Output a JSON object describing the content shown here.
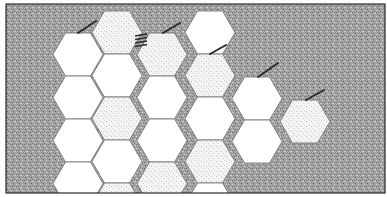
{
  "figure": {
    "width": 387,
    "height": 197,
    "frame": {
      "x": 6,
      "y": 4,
      "w": 379,
      "h": 189,
      "stroke": "#2a2a2a"
    },
    "background_color": "#9a9a9a",
    "hex": {
      "w": 50,
      "h": 43
    },
    "fills": {
      "white": "#ffffff",
      "stippled": "#ebebeb"
    },
    "outline_color": "#7a7a7a",
    "mark_color": "#2b2b2b",
    "columns": [
      {
        "name": "col-a",
        "x": 53,
        "cells": [
          {
            "y": 33,
            "fill": "white"
          },
          {
            "y": 76,
            "fill": "white"
          },
          {
            "y": 119,
            "fill": "white"
          },
          {
            "y": 162,
            "fill": "white"
          }
        ]
      },
      {
        "name": "col-b",
        "x": 92,
        "cells": [
          {
            "y": 11,
            "fill": "stippled"
          },
          {
            "y": 54,
            "fill": "white"
          },
          {
            "y": 97,
            "fill": "stippled"
          },
          {
            "y": 140,
            "fill": "white"
          },
          {
            "y": 183,
            "fill": "stippled"
          }
        ]
      },
      {
        "name": "col-c",
        "x": 137,
        "cells": [
          {
            "y": 33,
            "fill": "stippled"
          },
          {
            "y": 76,
            "fill": "white"
          },
          {
            "y": 119,
            "fill": "white"
          },
          {
            "y": 162,
            "fill": "stippled"
          }
        ]
      },
      {
        "name": "col-d",
        "x": 185,
        "cells": [
          {
            "y": 11,
            "fill": "white"
          },
          {
            "y": 54,
            "fill": "stippled"
          },
          {
            "y": 97,
            "fill": "white"
          },
          {
            "y": 140,
            "fill": "stippled"
          },
          {
            "y": 183,
            "fill": "white"
          }
        ]
      },
      {
        "name": "col-e",
        "x": 232,
        "cells": [
          {
            "y": 77,
            "fill": "white"
          },
          {
            "y": 120,
            "fill": "white"
          }
        ]
      },
      {
        "name": "col-f",
        "x": 280,
        "cells": [
          {
            "y": 100,
            "fill": "stippled"
          }
        ]
      }
    ],
    "marks": [
      {
        "type": "stroke",
        "x1": 78,
        "y1": 33,
        "x2": 96,
        "y2": 21
      },
      {
        "type": "stroke",
        "x1": 163,
        "y1": 33,
        "x2": 180,
        "y2": 23
      },
      {
        "type": "stroke",
        "x1": 210,
        "y1": 54,
        "x2": 226,
        "y2": 45
      },
      {
        "type": "stroke",
        "x1": 258,
        "y1": 77,
        "x2": 278,
        "y2": 63
      },
      {
        "type": "stroke",
        "x1": 306,
        "y1": 100,
        "x2": 324,
        "y2": 90
      },
      {
        "type": "ladder",
        "x": 135,
        "y": 34,
        "w": 12,
        "rungs": 4,
        "gap": 3.5
      }
    ]
  }
}
